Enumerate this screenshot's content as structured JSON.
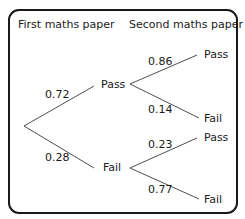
{
  "headers": {
    "first": "First maths paper",
    "second": "Second maths paper"
  },
  "tree": {
    "first_level": [
      {
        "outcome": "Pass",
        "prob": "0.72"
      },
      {
        "outcome": "Fail",
        "prob": "0.28"
      }
    ],
    "second_level": {
      "after_pass": [
        {
          "outcome": "Pass",
          "prob": "0.86"
        },
        {
          "outcome": "Fail",
          "prob": "0.14"
        }
      ],
      "after_fail": [
        {
          "outcome": "Pass",
          "prob": "0.23"
        },
        {
          "outcome": "Fail",
          "prob": "0.77"
        }
      ]
    }
  },
  "colors": {
    "line": "#3a3a3a",
    "text": "#1a1a1a",
    "background": "#ffffff"
  }
}
